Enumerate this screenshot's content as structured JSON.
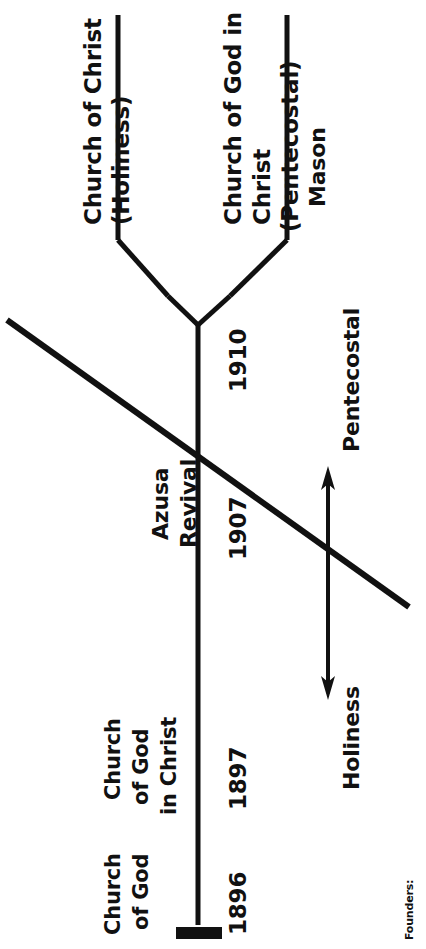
{
  "diagram": {
    "type": "lineage-timeline-tree",
    "orientation": "rotated-90-counterclockwise",
    "footer_label": "Founders:",
    "branch_labels": {
      "left_branch_line1": "Church of Christ",
      "left_branch_line2": "(Holiness)",
      "right_branch_line1": "Church of God in",
      "right_branch_line2": "Christ",
      "right_branch_line3": "(Pentecostal)",
      "right_branch_founder": "Mason"
    },
    "trunk_labels": {
      "event_line1": "Azusa",
      "event_line2": "Revival",
      "origin_line1": "Church",
      "origin_line2": "of God",
      "second_line1": "Church",
      "second_line2": "of God",
      "second_line3": "in Christ"
    },
    "years": {
      "split_year": "1910",
      "revival_year": "1907",
      "founding_year": "1896",
      "rename_year": "1897"
    },
    "spectrum_arrow": {
      "top_label": "Pentecostal",
      "bottom_label": "Holiness"
    },
    "colors": {
      "ink": "#111111",
      "background": "#ffffff"
    }
  }
}
